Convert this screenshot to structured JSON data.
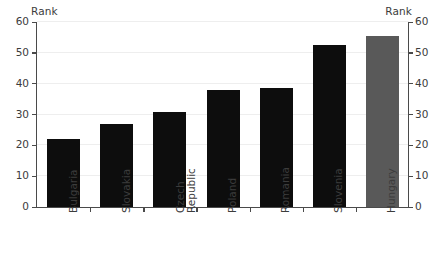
{
  "chart_data": {
    "type": "bar",
    "title": "",
    "subtitle": "",
    "xlabel": "",
    "ylabel": "Rank",
    "ylabel_right": "Rank",
    "ylim": [
      0,
      60
    ],
    "ytick_step": 10,
    "yticks": [
      0,
      10,
      20,
      30,
      40,
      50,
      60
    ],
    "ytick_labels": [
      "0",
      "10",
      "20",
      "30",
      "40",
      "50",
      "60"
    ],
    "grid": true,
    "grid_axis": "y",
    "legend": false,
    "legend_position": "none",
    "categories": [
      "Bulgaria",
      "Slovakia",
      "Czech\nRepublic",
      "Poland",
      "Romania",
      "Slovenia",
      "Hungary"
    ],
    "values": [
      22,
      27,
      30.7,
      37.8,
      38.6,
      52.5,
      55.5
    ],
    "bar_colors": [
      "#0d0d0d",
      "#0d0d0d",
      "#0d0d0d",
      "#0d0d0d",
      "#0d0d0d",
      "#0d0d0d",
      "#595959"
    ],
    "highlight_category": "Hungary",
    "highlight_color": "#595959",
    "series_color": "#0d0d0d",
    "axis_color": "#4a4a4a",
    "grid_color": "#eeeeee",
    "text_color": "#3c3c3c",
    "background": "#ffffff"
  }
}
